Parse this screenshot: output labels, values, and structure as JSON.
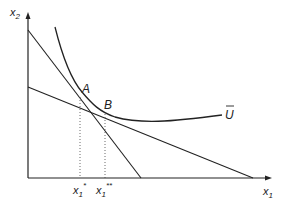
{
  "diagram": {
    "type": "indifference-curve-budget-lines",
    "axes": {
      "y_label": "x",
      "y_label_sub": "2",
      "x_label": "x",
      "x_label_sub": "1"
    },
    "points": {
      "A": "A",
      "B": "B"
    },
    "curve_label": "U",
    "tick_labels": {
      "x1_star": {
        "base": "x",
        "sub": "1",
        "sup": "*"
      },
      "x1_double_star": {
        "base": "x",
        "sub": "1",
        "sup": "**"
      }
    },
    "lines": [
      {
        "name": "steep-budget-line",
        "from": [
          28,
          30
        ],
        "to": [
          141,
          178
        ]
      },
      {
        "name": "shallow-budget-line",
        "from": [
          28,
          87
        ],
        "to": [
          253,
          178
        ]
      }
    ],
    "colors": {
      "ink": "#222222",
      "background": "#ffffff"
    }
  }
}
